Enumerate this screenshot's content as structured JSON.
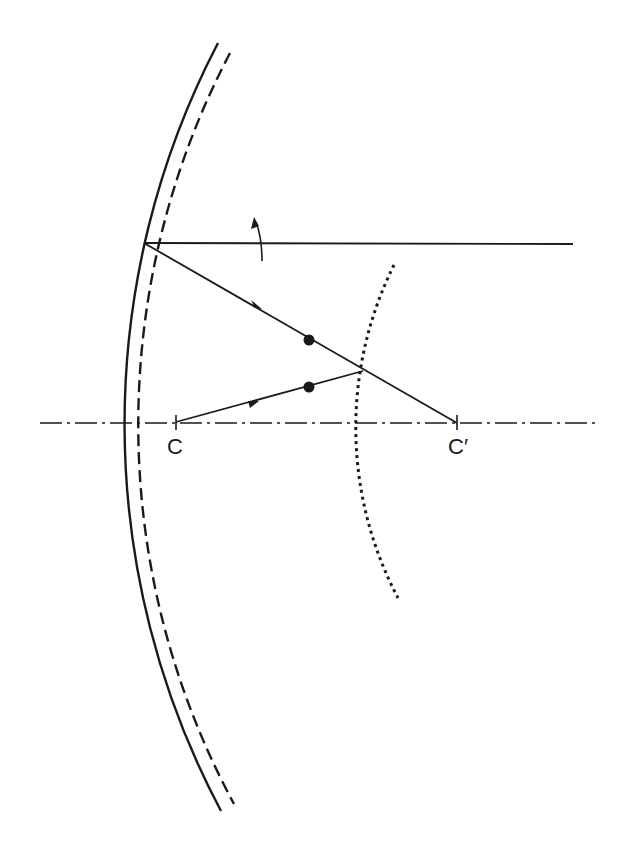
{
  "diagram": {
    "type": "optics-ray-diagram",
    "colors": {
      "ink": "#1a1a1a",
      "background": "#ffffff"
    },
    "labels": {
      "center_left": "C",
      "center_right": "C′"
    },
    "elements": {
      "solid_surface": "solid curved mirror surface",
      "dashed_surface": "dashed curved surface",
      "dotted_surface": "dotted curved surface",
      "optical_axis": "dash-dot optical axis",
      "incident_ray": "horizontal incoming ray",
      "reflected_ray": "ray toward C′",
      "ray_from_c": "ray from C",
      "rotation_arrow": "curved rotation arrow",
      "points": [
        "upper dot on reflected ray",
        "lower dot on ray from C"
      ]
    }
  }
}
